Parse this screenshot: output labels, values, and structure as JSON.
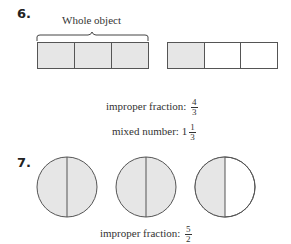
{
  "problem6": {
    "number": "6.",
    "brace_label": "Whole object",
    "bars": [
      {
        "cells": [
          true,
          true,
          true
        ]
      },
      {
        "cells": [
          true,
          false,
          false
        ]
      }
    ],
    "improper_label": "improper fraction:",
    "improper_num": "4",
    "improper_den": "3",
    "mixed_label": "mixed number:",
    "mixed_whole": "1",
    "mixed_num": "1",
    "mixed_den": "3"
  },
  "problem7": {
    "number": "7.",
    "circles": [
      {
        "left": true,
        "right": true
      },
      {
        "left": true,
        "right": true
      },
      {
        "left": true,
        "right": false
      }
    ],
    "improper_label": "improper fraction:",
    "improper_num": "5",
    "improper_den": "2"
  },
  "colors": {
    "shade": "#e6e6e6",
    "stroke": "#555555"
  }
}
